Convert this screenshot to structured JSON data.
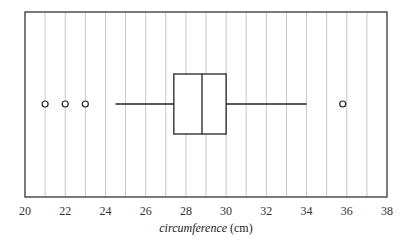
{
  "chart_data": {
    "type": "boxplot",
    "orientation": "horizontal",
    "title": "",
    "xlabel": "circumference (cm)",
    "xlabel_italic_part": "circumference",
    "xlabel_unit_part": " (cm)",
    "ylabel": "",
    "xlim": [
      20,
      38
    ],
    "x_ticks": [
      20,
      22,
      24,
      26,
      28,
      30,
      32,
      34,
      36,
      38
    ],
    "x_tick_labels": [
      "20",
      "22",
      "24",
      "26",
      "28",
      "30",
      "32",
      "34",
      "36",
      "38"
    ],
    "grid": "vertical lines every 1 unit",
    "box": {
      "whisker_low": 24.5,
      "q1": 27.4,
      "median": 28.8,
      "q3": 30,
      "whisker_high": 34
    },
    "outliers": [
      21,
      22,
      23,
      35.8
    ]
  }
}
